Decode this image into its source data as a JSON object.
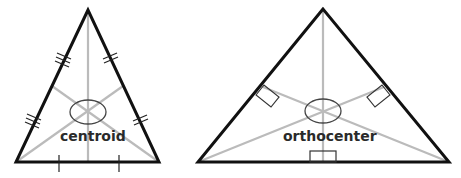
{
  "diagrams": [
    {
      "name": "centroid",
      "label": "centroid",
      "description": "Triangle with three medians meeting at the centroid; equal-segment tick marks on each side"
    },
    {
      "name": "orthocenter",
      "label": "orthocenter",
      "description": "Triangle with three altitudes meeting at the orthocenter; right-angle markers at each foot"
    }
  ],
  "colors": {
    "triangle_stroke": "#111111",
    "inner_lines": "#bbbbbb",
    "marker_stroke": "#333333",
    "label": "#2a2a2a"
  }
}
